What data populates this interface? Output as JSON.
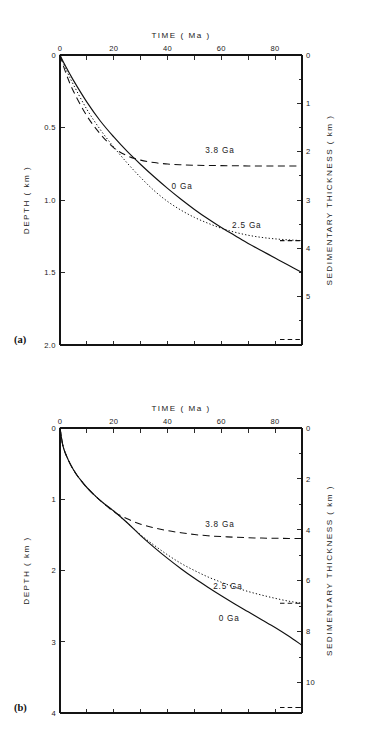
{
  "figure": {
    "panels": [
      {
        "id": "a",
        "label": "(a)",
        "top_axis": {
          "title": "TIME ( Ma )",
          "tick_values": [
            0,
            10,
            20,
            30,
            40,
            50,
            60,
            70,
            80,
            90
          ],
          "labeled_ticks": [
            {
              "value": 0,
              "text": "0"
            },
            {
              "value": 20,
              "text": "20"
            },
            {
              "value": 40,
              "text": "40"
            },
            {
              "value": 60,
              "text": "60"
            },
            {
              "value": 80,
              "text": "80"
            }
          ],
          "range": [
            0,
            90
          ]
        },
        "left_axis": {
          "title": "DEPTH  ( km )",
          "labeled_ticks": [
            {
              "value": 0,
              "text": "0"
            },
            {
              "value": 0.5,
              "text": "0.5"
            },
            {
              "value": 1.0,
              "text": "1.0"
            },
            {
              "value": 1.5,
              "text": "1.5"
            },
            {
              "value": 2.0,
              "text": "2.0"
            }
          ],
          "range": [
            0,
            2.0
          ]
        },
        "right_axis": {
          "title": "SEDIMENTARY  THICKNESS  ( km )",
          "labeled_ticks": [
            {
              "value": 0,
              "text": "0"
            },
            {
              "value": 1,
              "text": "1"
            },
            {
              "value": 2,
              "text": "2"
            },
            {
              "value": 3,
              "text": "3"
            },
            {
              "value": 4,
              "text": "4"
            },
            {
              "value": 5,
              "text": "5"
            }
          ],
          "range": [
            0,
            6.0
          ]
        },
        "curve_labels": [
          {
            "text": "3.8 Ga",
            "x": 54,
            "depth": 0.655
          },
          {
            "text": "0 Ga",
            "x": 41.5,
            "depth": 0.905
          },
          {
            "text": "2.5 Ga",
            "x": 64,
            "depth": 1.175
          }
        ]
      },
      {
        "id": "b",
        "label": "(b)",
        "top_axis": {
          "title": "TIME ( Ma )",
          "tick_values": [
            0,
            10,
            20,
            30,
            40,
            50,
            60,
            70,
            80,
            90
          ],
          "labeled_ticks": [
            {
              "value": 0,
              "text": "0"
            },
            {
              "value": 20,
              "text": "20"
            },
            {
              "value": 40,
              "text": "40"
            },
            {
              "value": 60,
              "text": "60"
            },
            {
              "value": 80,
              "text": "80"
            }
          ],
          "range": [
            0,
            90
          ]
        },
        "left_axis": {
          "title": "DEPTH  ( km )",
          "labeled_ticks": [
            {
              "value": 0,
              "text": "0"
            },
            {
              "value": 1,
              "text": "1"
            },
            {
              "value": 2,
              "text": "2"
            },
            {
              "value": 3,
              "text": "3"
            },
            {
              "value": 4,
              "text": "4"
            }
          ],
          "range": [
            0,
            4.0
          ]
        },
        "right_axis": {
          "title": "SEDIMENTARY  THICKNESS  ( km )",
          "labeled_ticks": [
            {
              "value": 0,
              "text": "0"
            },
            {
              "value": 2,
              "text": "2"
            },
            {
              "value": 4,
              "text": "4"
            },
            {
              "value": 6,
              "text": "6"
            },
            {
              "value": 8,
              "text": "8"
            },
            {
              "value": 10,
              "text": "10"
            }
          ],
          "range": [
            0,
            11.2
          ]
        },
        "curve_labels": [
          {
            "text": "3.8 Ga",
            "x": 54,
            "depth": 1.345
          },
          {
            "text": "2.5 Ga",
            "x": 57,
            "depth": 2.215
          },
          {
            "text": "0 Ga",
            "x": 59,
            "depth": 2.66
          }
        ]
      }
    ]
  },
  "chart_data": [
    {
      "type": "line",
      "panel": "a",
      "title": "",
      "xlabel": "TIME ( Ma )",
      "ylabel": "DEPTH ( km )",
      "y2label": "SEDIMENTARY THICKNESS ( km )",
      "xlim": [
        0,
        90
      ],
      "ylim": [
        2.0,
        0
      ],
      "y2lim": [
        6.0,
        0
      ],
      "y_inverted": true,
      "grid": false,
      "legend": "inline-annotations",
      "xticks": [
        0,
        10,
        20,
        30,
        40,
        50,
        60,
        70,
        80,
        90
      ],
      "xticklabels": [
        "0",
        "",
        "20",
        "",
        "40",
        "",
        "60",
        "",
        "80",
        ""
      ],
      "yticks": [
        0,
        0.5,
        1.0,
        1.5,
        2.0
      ],
      "yticklabels": [
        "0",
        "0.5",
        "1.0",
        "1.5",
        "2.0"
      ],
      "y2ticks": [
        0,
        1,
        2,
        3,
        4,
        5
      ],
      "y2ticklabels": [
        "0",
        "1",
        "2",
        "3",
        "4",
        "5"
      ],
      "x": [
        0,
        2,
        5,
        10,
        15,
        20,
        25,
        30,
        35,
        40,
        45,
        50,
        55,
        60,
        65,
        70,
        75,
        80,
        85,
        90
      ],
      "series": [
        {
          "name": "0 Ga",
          "style": "solid",
          "values": [
            0.0,
            0.075,
            0.175,
            0.325,
            0.455,
            0.565,
            0.665,
            0.755,
            0.84,
            0.92,
            0.995,
            1.065,
            1.13,
            1.19,
            1.245,
            1.3,
            1.35,
            1.4,
            1.45,
            1.5
          ]
        },
        {
          "name": "2.5 Ga",
          "style": "dotted",
          "values": [
            0.0,
            0.09,
            0.205,
            0.375,
            0.515,
            0.635,
            0.745,
            0.845,
            0.935,
            1.01,
            1.07,
            1.12,
            1.16,
            1.195,
            1.222,
            1.243,
            1.258,
            1.268,
            1.275,
            1.28
          ]
        },
        {
          "name": "3.8 Ga",
          "style": "dashed",
          "values": [
            0.0,
            0.115,
            0.25,
            0.42,
            0.545,
            0.64,
            0.695,
            0.725,
            0.742,
            0.752,
            0.757,
            0.76,
            0.762,
            0.763,
            0.764,
            0.765,
            0.765,
            0.765,
            0.765,
            0.765
          ]
        }
      ],
      "annotations": [
        {
          "text": "3.8 Ga",
          "x": 54,
          "y": 0.655
        },
        {
          "text": "0 Ga",
          "x": 41.5,
          "y": 0.905
        },
        {
          "text": "2.5 Ga",
          "x": 64,
          "y": 1.175
        }
      ]
    },
    {
      "type": "line",
      "panel": "b",
      "title": "",
      "xlabel": "TIME ( Ma )",
      "ylabel": "DEPTH ( km )",
      "y2label": "SEDIMENTARY THICKNESS ( km )",
      "xlim": [
        0,
        90
      ],
      "ylim": [
        4.0,
        0
      ],
      "y2lim": [
        11.2,
        0
      ],
      "y_inverted": true,
      "grid": false,
      "legend": "inline-annotations",
      "xticks": [
        0,
        10,
        20,
        30,
        40,
        50,
        60,
        70,
        80,
        90
      ],
      "xticklabels": [
        "0",
        "",
        "20",
        "",
        "40",
        "",
        "60",
        "",
        "80",
        ""
      ],
      "yticks": [
        0,
        1,
        2,
        3,
        4
      ],
      "yticklabels": [
        "0",
        "1",
        "2",
        "3",
        "4"
      ],
      "y2ticks": [
        0,
        2,
        4,
        6,
        8,
        10
      ],
      "y2ticklabels": [
        "0",
        "2",
        "4",
        "6",
        "8",
        "10"
      ],
      "x": [
        0,
        1,
        2,
        4,
        6,
        8,
        10,
        13,
        16,
        20,
        25,
        30,
        35,
        40,
        45,
        50,
        55,
        60,
        65,
        70,
        75,
        80,
        85,
        90
      ],
      "series": [
        {
          "name": "0 Ga",
          "style": "solid",
          "values": [
            0.0,
            0.235,
            0.355,
            0.52,
            0.645,
            0.745,
            0.835,
            0.95,
            1.05,
            1.165,
            1.33,
            1.51,
            1.675,
            1.83,
            1.975,
            2.11,
            2.235,
            2.355,
            2.47,
            2.58,
            2.69,
            2.8,
            2.92,
            3.05
          ]
        },
        {
          "name": "2.5 Ga",
          "style": "dotted",
          "values": [
            0.0,
            0.235,
            0.355,
            0.52,
            0.645,
            0.745,
            0.835,
            0.95,
            1.05,
            1.17,
            1.33,
            1.5,
            1.645,
            1.78,
            1.9,
            2.0,
            2.09,
            2.165,
            2.235,
            2.295,
            2.345,
            2.39,
            2.43,
            2.46
          ]
        },
        {
          "name": "3.8 Ga",
          "style": "dashed",
          "values": [
            0.0,
            0.235,
            0.355,
            0.52,
            0.645,
            0.745,
            0.835,
            0.95,
            1.05,
            1.175,
            1.275,
            1.35,
            1.4,
            1.44,
            1.47,
            1.495,
            1.512,
            1.524,
            1.533,
            1.54,
            1.545,
            1.548,
            1.55,
            1.552
          ]
        }
      ],
      "annotations": [
        {
          "text": "3.8 Ga",
          "x": 54,
          "y": 1.345
        },
        {
          "text": "2.5 Ga",
          "x": 57,
          "y": 2.215
        },
        {
          "text": "0 Ga",
          "x": 59,
          "y": 2.66
        }
      ]
    }
  ]
}
